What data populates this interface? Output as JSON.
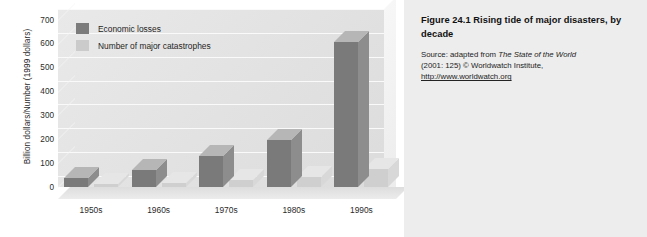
{
  "figure": {
    "caption_title": "Figure 24.1  Rising tide of major disasters, by decade",
    "source_prefix": "Source: adapted from ",
    "source_italic": "The State of the World",
    "source_mid": "(2001: 125) © Worldwatch Institute,",
    "source_url": "http://www.worldwatch.org"
  },
  "legend": {
    "items": [
      {
        "label": "Economic losses",
        "color": "#7a7a7a"
      },
      {
        "label": "Number of major catastrophes",
        "color": "#cfcfcf"
      }
    ]
  },
  "chart_data": {
    "type": "bar",
    "title": "Rising tide of major disasters, by decade",
    "xlabel": "",
    "ylabel": "Billion dollars/Number (1999 dollars)",
    "ylim": [
      0,
      700
    ],
    "yticks": [
      0,
      100,
      200,
      300,
      400,
      500,
      600,
      700
    ],
    "ytick_labels": [
      "0",
      "100",
      "200",
      "300",
      "400",
      "500",
      "600",
      "700"
    ],
    "grid": true,
    "legend_position": "upper-left-inside",
    "categories": [
      "1950s",
      "1960s",
      "1970s",
      "1980s",
      "1990s"
    ],
    "series": [
      {
        "name": "Economic losses",
        "color": "#7a7a7a",
        "values": [
          39,
          71,
          128,
          197,
          608
        ]
      },
      {
        "name": "Number of major catastrophes",
        "color": "#cfcfcf",
        "values": [
          13,
          16,
          29,
          44,
          74
        ]
      }
    ]
  }
}
